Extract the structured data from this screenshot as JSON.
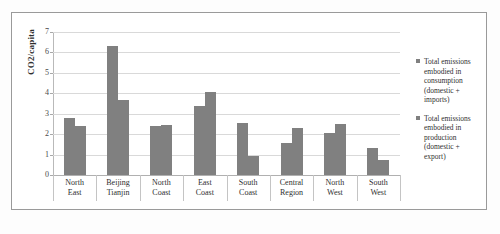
{
  "chart_data": {
    "type": "bar",
    "title": "",
    "xlabel": "",
    "ylabel": "CO2/capita",
    "ylim": [
      0,
      7
    ],
    "yticks": [
      0,
      1,
      2,
      3,
      4,
      5,
      6,
      7
    ],
    "grid": true,
    "legend_position": "right",
    "categories": [
      [
        "North",
        "East"
      ],
      [
        "Beijing",
        "Tianjin"
      ],
      [
        "North",
        "Coast"
      ],
      [
        "East",
        "Coast"
      ],
      [
        "South",
        "Coast"
      ],
      [
        "Central",
        "Region"
      ],
      [
        "North",
        "West"
      ],
      [
        "South",
        "West"
      ]
    ],
    "category_labels": [
      "North East",
      "Beijing Tianjin",
      "North Coast",
      "East Coast",
      "South Coast",
      "Central Region",
      "North West",
      "South West"
    ],
    "series": [
      {
        "name": "Total emissions embodied in consumption (domestic + imports)",
        "color": "#808080",
        "values": [
          2.8,
          6.3,
          2.4,
          3.4,
          2.55,
          1.55,
          2.05,
          1.3
        ]
      },
      {
        "name": "Total emissions embodied in production (domestic + export)",
        "color": "#808080",
        "values": [
          2.4,
          3.65,
          2.47,
          4.05,
          0.95,
          2.3,
          2.5,
          0.75
        ]
      }
    ]
  },
  "legend": {
    "entries": [
      {
        "lines": [
          "Total emissions",
          "embodied in",
          "consumption",
          "(domestic +",
          "imports)"
        ]
      },
      {
        "lines": [
          "Total emissions",
          "embodied in",
          "production",
          "(domestic +",
          "export)"
        ]
      }
    ]
  },
  "colors": {
    "bar": "#808080",
    "gridline": "#d9d9d9",
    "axis": "#b0b0b0",
    "frame": "#9a9a9a",
    "text": "#2f2f2f",
    "background": "#ffffff"
  }
}
